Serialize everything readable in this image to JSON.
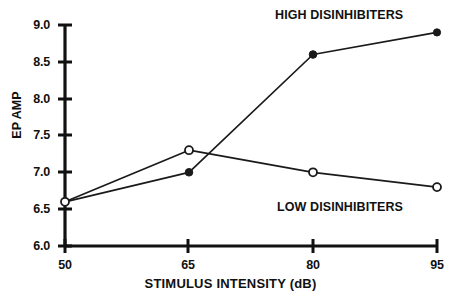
{
  "chart_data": {
    "type": "line",
    "title": "",
    "xlabel": "STIMULUS INTENSITY (dB)",
    "ylabel": "EP AMP",
    "x": [
      50,
      65,
      80,
      95
    ],
    "xticklabels": [
      "50",
      "65",
      "80",
      "95"
    ],
    "xlim": [
      50,
      95
    ],
    "ylim": [
      6.0,
      9.0
    ],
    "yticks": [
      6.0,
      6.5,
      7.0,
      7.5,
      8.0,
      8.5,
      9.0
    ],
    "yticklabels": [
      "6.0",
      "6.5",
      "7.0",
      "7.5",
      "8.0",
      "8.5",
      "9.0"
    ],
    "grid": false,
    "legend_position": "inline-annotation",
    "series": [
      {
        "name": "HIGH DISINHIBITERS",
        "marker": "filled-circle",
        "color": "#1a1a1a",
        "values": [
          6.6,
          7.0,
          8.6,
          8.9
        ]
      },
      {
        "name": "LOW DISINHIBITERS",
        "marker": "open-circle",
        "color": "#1a1a1a",
        "values": [
          6.6,
          7.3,
          7.0,
          6.8
        ]
      }
    ],
    "annotations": [
      {
        "text": "HIGH DISINHIBITERS",
        "series": "HIGH DISINHIBITERS"
      },
      {
        "text": "LOW DISINHIBITERS",
        "series": "LOW DISINHIBITERS"
      }
    ]
  }
}
